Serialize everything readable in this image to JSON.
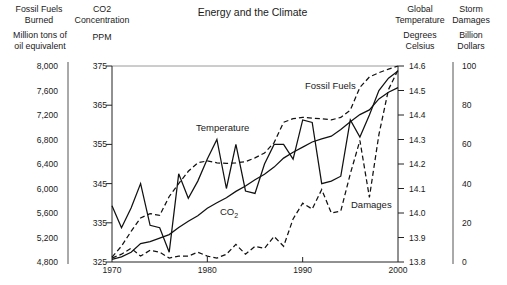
{
  "title": "Energy and the Climate",
  "axes": {
    "fossil": {
      "header_line1": "Fossil Fuels",
      "header_line2": "Burned",
      "unit_line1": "Million tons of",
      "unit_line2": "oil equivalent",
      "ticks": [
        "8,000",
        "7,600",
        "7,200",
        "6,800",
        "6,400",
        "6,000",
        "5,600",
        "5,200",
        "4,800"
      ],
      "min": 4800,
      "max": 8000
    },
    "co2": {
      "header_line1": "CO2",
      "header_line2": "Concentration",
      "unit_line1": "PPM",
      "ticks": [
        "375",
        "365",
        "355",
        "345",
        "335",
        "325"
      ],
      "min": 325,
      "max": 375
    },
    "temperature": {
      "header_line1": "Global",
      "header_line2": "Temperature",
      "unit_line1": "Degrees",
      "unit_line2": "Celsius",
      "ticks": [
        "14.6",
        "14.5",
        "14.4",
        "14.3",
        "14.2",
        "14.1",
        "14.0",
        "13.9",
        "13.8"
      ],
      "min": 13.8,
      "max": 14.6
    },
    "damages": {
      "header_line1": "Storm",
      "header_line2": "Damages",
      "unit_line1": "Billion",
      "unit_line2": "Dollars",
      "ticks": [
        "100",
        "80",
        "60",
        "40",
        "20",
        "0"
      ],
      "min": 0,
      "max": 100
    },
    "x": {
      "tick_labels": [
        "1970",
        "1980",
        "1990",
        "2000"
      ],
      "tick_years": [
        1970,
        1980,
        1990,
        2000
      ],
      "inner_tick_years": [
        1980,
        1990
      ],
      "min": 1970,
      "max": 2000
    }
  },
  "chart_data": {
    "type": "line",
    "title": "Energy and the Climate",
    "x": [
      1970,
      1971,
      1972,
      1973,
      1974,
      1975,
      1976,
      1977,
      1978,
      1979,
      1980,
      1981,
      1982,
      1983,
      1984,
      1985,
      1986,
      1987,
      1988,
      1989,
      1990,
      1991,
      1992,
      1993,
      1994,
      1995,
      1996,
      1997,
      1998,
      1999,
      2000
    ],
    "series": [
      {
        "name": "fossil-fuels",
        "label": "Fossil Fuels",
        "axis": "fossil",
        "unit": "million tons of oil equivalent",
        "style": "dashed",
        "values": [
          4880,
          5060,
          5300,
          5520,
          5590,
          5560,
          5870,
          6080,
          6280,
          6420,
          6450,
          6420,
          6410,
          6420,
          6440,
          6500,
          6580,
          6750,
          7080,
          7140,
          7160,
          7150,
          7140,
          7120,
          7160,
          7280,
          7650,
          7820,
          7890,
          7950,
          8000
        ]
      },
      {
        "name": "temperature",
        "label": "Temperature",
        "axis": "temperature",
        "unit": "degrees Celsius",
        "style": "solid",
        "values": [
          14.03,
          13.94,
          14.02,
          14.12,
          13.95,
          13.94,
          13.84,
          14.16,
          14.06,
          14.13,
          14.22,
          14.3,
          14.1,
          14.28,
          14.09,
          14.08,
          14.2,
          14.28,
          14.28,
          14.22,
          14.38,
          14.37,
          14.12,
          14.13,
          14.15,
          14.38,
          14.31,
          14.4,
          14.5,
          14.55,
          14.58
        ]
      },
      {
        "name": "co2",
        "label": "CO2",
        "label_main": "CO",
        "label_sub": "2",
        "axis": "co2",
        "unit": "PPM",
        "style": "solid",
        "values": [
          325.7,
          326.3,
          327.5,
          329.7,
          330.2,
          331.1,
          332.0,
          333.8,
          335.4,
          336.8,
          338.7,
          340.1,
          341.4,
          343.0,
          344.4,
          346.0,
          347.4,
          349.2,
          351.5,
          353.0,
          354.3,
          355.6,
          356.4,
          357.1,
          358.8,
          360.8,
          362.6,
          363.8,
          366.6,
          368.3,
          369.5
        ]
      },
      {
        "name": "damages",
        "label": "Damages",
        "axis": "damages",
        "unit": "billion dollars",
        "style": "dashed",
        "values": [
          2,
          4,
          7,
          3,
          6,
          5,
          2,
          3,
          3,
          5,
          3,
          2,
          4,
          9,
          4,
          8,
          7,
          13,
          8,
          22,
          30,
          27,
          37,
          25,
          26,
          45,
          62,
          33,
          65,
          88,
          98
        ]
      }
    ],
    "xlim": [
      1970,
      2000
    ],
    "grid": false,
    "legend": "inline-annotations",
    "line_color": "#111111"
  }
}
